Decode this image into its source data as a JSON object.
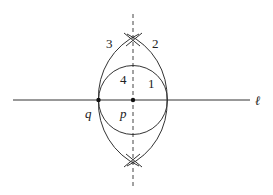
{
  "figure": {
    "line_label": "ℓ",
    "points": [
      {
        "id": "q",
        "label": "q"
      },
      {
        "id": "p",
        "label": "p"
      }
    ],
    "arc_labels": {
      "arc1": "1",
      "arc2": "2",
      "arc3": "3",
      "arc4": "4"
    },
    "colors": {
      "stroke": "#333333",
      "dashed": "#444444",
      "point": "#111111",
      "text": "#222222"
    }
  }
}
